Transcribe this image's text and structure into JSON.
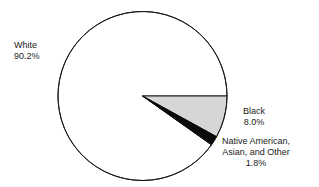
{
  "chart_data": {
    "type": "pie",
    "title": "",
    "subtitle": "",
    "xlabel": "",
    "ylabel": "",
    "legend_position": "outside-labels",
    "grid": false,
    "start_angle_deg": 0,
    "direction": "clockwise",
    "categories": [
      "White",
      "Black",
      "Native American, Asian, and Other"
    ],
    "values": [
      90.2,
      8.0,
      1.8
    ],
    "value_unit": "percent",
    "slices": [
      {
        "label": "White",
        "value": 90.2,
        "value_text": "90.2%",
        "fill": "#ffffff",
        "stroke": "#1a1a1a",
        "start_deg": 35.28,
        "end_deg": 360.0,
        "label_position": "upper-left"
      },
      {
        "label": "Black",
        "value": 8.0,
        "value_text": "8.0%",
        "fill": "#d6d6d6",
        "stroke": "#1a1a1a",
        "start_deg": 0.0,
        "end_deg": 28.8,
        "label_position": "right"
      },
      {
        "label": "Native American, Asian, and Other",
        "value": 1.8,
        "value_text": "1.8%",
        "fill": "#0a0a0a",
        "stroke": "#0a0a0a",
        "start_deg": 28.8,
        "end_deg": 35.28,
        "label_position": "lower-right"
      }
    ]
  },
  "geometry": {
    "center_x": 142.5,
    "center_y": 96,
    "radius": 84.5
  },
  "labels": {
    "white": {
      "name": "White",
      "percent": "90.2%"
    },
    "black": {
      "name": "Black",
      "percent": "8.0%"
    },
    "other": {
      "line1": "Native American,",
      "line2": "Asian, and Other",
      "percent": "1.8%"
    }
  },
  "colors": {
    "slice_white": "#ffffff",
    "slice_gray": "#d6d6d6",
    "slice_black": "#0a0a0a",
    "outline": "#1a1a1a",
    "text": "#1a1a1a",
    "background": "#ffffff"
  }
}
